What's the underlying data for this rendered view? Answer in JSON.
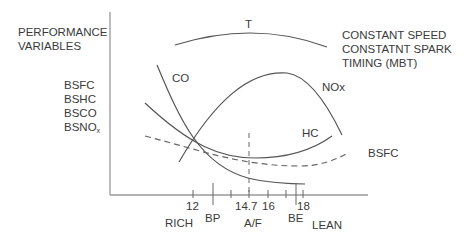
{
  "title_left": [
    "PERFORMANCE",
    "VARIABLES"
  ],
  "title_right": [
    "CONSTANT SPEED",
    "CONSTATNT SPARK",
    "TIMING (MBT)"
  ],
  "y_variables": [
    "BSFC",
    "BSHC",
    "BSCO",
    "BSNO"
  ],
  "y_variable_subscript": "x",
  "curve_labels": {
    "t": "T",
    "co": "CO",
    "nox": "NOx",
    "hc": "HC",
    "bsfc": "BSFC"
  },
  "x_ticks": [
    "12",
    "14.7",
    "16",
    "18"
  ],
  "x_markers": {
    "bp": "BP",
    "be": "BE"
  },
  "x_labels": {
    "rich": "RICH",
    "af": "A/F",
    "lean": "LEAN"
  },
  "colors": {
    "line": "#555555",
    "text": "#3a3a3a",
    "axis": "#888888"
  }
}
